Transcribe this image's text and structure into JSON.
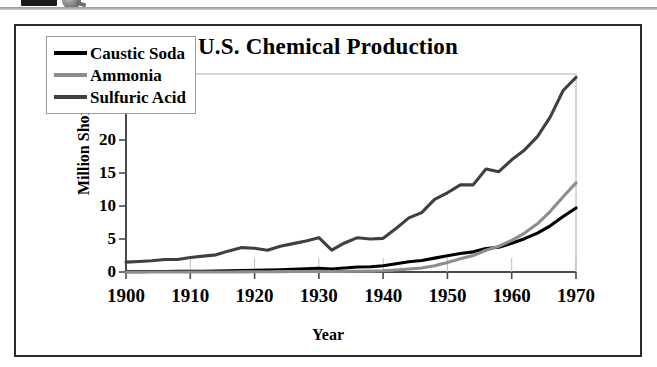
{
  "scan_artifact": {
    "name": "partial-toolbar-strip",
    "description": "cut-off UI element at top edge of scanned page"
  },
  "figure": {
    "title": "U.S. Chemical Production",
    "x_axis_title": "Year",
    "y_axis_title": "Million Short Tons"
  },
  "legend": {
    "items": [
      {
        "label": "Caustic Soda",
        "color": "#000000"
      },
      {
        "label": "Ammonia",
        "color": "#8d8d8d"
      },
      {
        "label": "Sulfuric Acid",
        "color": "#404040"
      }
    ]
  },
  "chart_data": {
    "type": "line",
    "title": "U.S. Chemical Production",
    "xlabel": "Year",
    "ylabel": "Million Short Tons",
    "xlim": [
      1900,
      1970
    ],
    "ylim": [
      0,
      30
    ],
    "xticks": [
      1900,
      1910,
      1920,
      1930,
      1940,
      1950,
      1960,
      1970
    ],
    "yticks": [
      0,
      5,
      10,
      15,
      20,
      25,
      30
    ],
    "grid": false,
    "legend_position": "upper left",
    "x": [
      1900,
      1902,
      1904,
      1906,
      1908,
      1910,
      1912,
      1914,
      1916,
      1918,
      1920,
      1922,
      1924,
      1926,
      1928,
      1930,
      1932,
      1934,
      1936,
      1938,
      1940,
      1942,
      1944,
      1946,
      1948,
      1950,
      1952,
      1954,
      1956,
      1958,
      1960,
      1962,
      1964,
      1966,
      1968,
      1970
    ],
    "series": [
      {
        "name": "Sulfuric Acid",
        "color": "#404040",
        "units": "million short tons",
        "values": [
          1.5,
          1.6,
          1.7,
          1.9,
          1.9,
          2.2,
          2.4,
          2.6,
          3.2,
          3.7,
          3.6,
          3.3,
          3.9,
          4.3,
          4.7,
          5.2,
          3.3,
          4.4,
          5.2,
          5.0,
          5.1,
          6.6,
          8.2,
          9.0,
          11.0,
          12.0,
          13.2,
          13.2,
          15.6,
          15.2,
          17.0,
          18.5,
          20.5,
          23.5,
          27.5,
          29.5
        ]
      },
      {
        "name": "Caustic Soda",
        "color": "#000000",
        "units": "million short tons",
        "values": [
          0.05,
          0.06,
          0.07,
          0.08,
          0.09,
          0.1,
          0.12,
          0.14,
          0.18,
          0.22,
          0.25,
          0.28,
          0.33,
          0.4,
          0.48,
          0.55,
          0.45,
          0.6,
          0.75,
          0.8,
          0.95,
          1.25,
          1.55,
          1.75,
          2.1,
          2.45,
          2.8,
          3.05,
          3.55,
          3.75,
          4.35,
          5.05,
          5.9,
          7.0,
          8.4,
          9.7
        ]
      },
      {
        "name": "Ammonia",
        "color": "#8d8d8d",
        "units": "million short tons",
        "values": [
          0.0,
          0.0,
          0.0,
          0.0,
          0.0,
          0.0,
          0.0,
          0.0,
          0.0,
          0.02,
          0.03,
          0.04,
          0.05,
          0.07,
          0.08,
          0.1,
          0.08,
          0.1,
          0.12,
          0.14,
          0.18,
          0.3,
          0.45,
          0.6,
          0.95,
          1.45,
          2.0,
          2.5,
          3.3,
          3.9,
          4.8,
          5.9,
          7.3,
          9.2,
          11.4,
          13.5
        ]
      }
    ]
  }
}
